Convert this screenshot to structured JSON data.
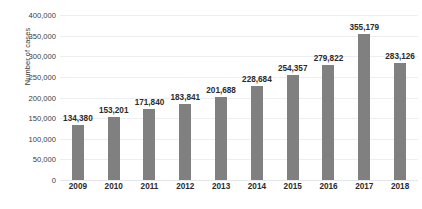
{
  "chart_data": {
    "type": "bar",
    "title": "",
    "subtitle": "",
    "xlabel": "",
    "ylabel": "Number of cases",
    "categories": [
      "2009",
      "2010",
      "2011",
      "2012",
      "2013",
      "2014",
      "2015",
      "2016",
      "2017",
      "2018"
    ],
    "values": [
      134380,
      153201,
      171840,
      183841,
      201688,
      228684,
      254357,
      279822,
      355179,
      283126
    ],
    "value_labels": [
      "134,380",
      "153,201",
      "171,840",
      "183,841",
      "201,688",
      "228,684",
      "254,357",
      "279,822",
      "355,179",
      "283,126"
    ],
    "series": [
      {
        "name": "Number of cases",
        "values": [
          134380,
          153201,
          171840,
          183841,
          201688,
          228684,
          254357,
          279822,
          355179,
          283126
        ]
      }
    ],
    "ylim": [
      0,
      400000
    ],
    "ytick_values": [
      0,
      50000,
      100000,
      150000,
      200000,
      250000,
      300000,
      350000,
      400000
    ],
    "ytick_labels": [
      "0",
      "50,000",
      "100,000",
      "150,000",
      "200,000",
      "250,000",
      "300,000",
      "350,000",
      "400,000"
    ],
    "grid": true,
    "grid_axis": "y",
    "legend": false,
    "legend_position": "none",
    "data_labels": true,
    "bar_color": "#808080",
    "gridline_color": "#eceff1",
    "text_color": "#2b2b2b",
    "background_color": "#ffffff",
    "annotations": []
  }
}
